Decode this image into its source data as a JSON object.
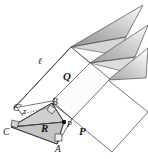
{
  "figure": {
    "background_color": "#ffffff",
    "stroke_color": "#3a3a3a",
    "label_color": "#141414",
    "fill_light": "#d9d9d9",
    "fill_mid": "#bdbdbd",
    "fill_dark": "#8c8c8c"
  },
  "planes": [
    {
      "id": "plane-P",
      "label": "P",
      "x": 79,
      "y": 131
    },
    {
      "id": "plane-Q",
      "label": "Q",
      "x": 63,
      "y": 76
    },
    {
      "id": "plane-R",
      "label": "R",
      "x": 41,
      "y": 128
    }
  ],
  "points": [
    {
      "id": "point-A",
      "label": "A",
      "x": 55,
      "y": 146
    },
    {
      "id": "point-B",
      "label": "B",
      "x": 52,
      "y": 101
    },
    {
      "id": "point-C",
      "label": "C",
      "x": 4,
      "y": 130
    },
    {
      "id": "point-C-prime",
      "label": "C'",
      "x": 14,
      "y": 107
    },
    {
      "id": "point-P",
      "label": "P",
      "x": 64,
      "y": 124
    }
  ],
  "lines": [
    {
      "id": "line-ell",
      "label": "ℓ",
      "x": 38,
      "y": 60
    }
  ],
  "annotations": [
    {
      "id": "angle-z",
      "label": "z",
      "x": 24,
      "y": 110
    },
    {
      "id": "dotted-leader",
      "label": "",
      "x": 30,
      "y": 113
    }
  ],
  "right_angle_markers": [
    {
      "id": "right-angle-at-B",
      "vertex": "B"
    },
    {
      "id": "right-angle-at-A",
      "vertex": "A"
    },
    {
      "id": "right-angle-at-C",
      "vertex": "C"
    },
    {
      "id": "right-angle-at-P",
      "vertex": "P"
    }
  ]
}
